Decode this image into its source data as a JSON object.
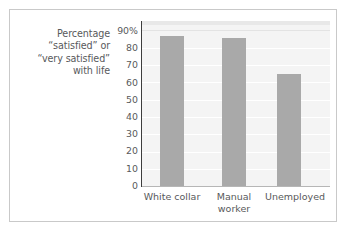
{
  "figure": {
    "background_color": "#ffffff",
    "frame_border_color": "#c9c9c9",
    "axis_label_color": "#58595b",
    "plot_background_color": "#f4f4f4",
    "bar_color": "#a9a9a9",
    "gridline_color": "#ffffff"
  },
  "chart_data": {
    "type": "bar",
    "title": "",
    "subtitle": "",
    "xlabel": "",
    "ylabel": "Percentage\n“satisfied” or\n“very satisfied”\nwith life",
    "categories": [
      "White collar",
      "Manual\nworker",
      "Unemployed"
    ],
    "category_labels_flat": [
      "White collar",
      "Manual worker",
      "Unemployed"
    ],
    "values": [
      82,
      81,
      61
    ],
    "ylim": [
      0,
      90
    ],
    "yticks": [
      90,
      80,
      70,
      60,
      50,
      40,
      30,
      20,
      10,
      0
    ],
    "ytick_labels": [
      "90%",
      "80",
      "70",
      "60",
      "50",
      "40",
      "30",
      "20",
      "10",
      "0"
    ],
    "grid": true,
    "legend": false,
    "legend_position": "none",
    "units": "percent"
  }
}
